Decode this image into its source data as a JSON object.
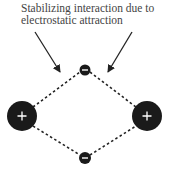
{
  "caption": {
    "line1": "Stabilizing interaction due to",
    "line2": "electrostatic attraction"
  },
  "colors": {
    "ion_fill": "#1a1a1a",
    "sign": "#ffffff",
    "line": "#222222",
    "text": "#444444"
  },
  "ions": [
    {
      "name": "cation-left",
      "charge": "+",
      "cx": 22,
      "cy": 116,
      "r": 15
    },
    {
      "name": "cation-right",
      "charge": "+",
      "cx": 147,
      "cy": 116,
      "r": 15
    },
    {
      "name": "anion-top",
      "charge": "-",
      "cx": 85,
      "cy": 70,
      "r": 5.5
    },
    {
      "name": "anion-bottom",
      "charge": "-",
      "cx": 85,
      "cy": 158,
      "r": 6
    }
  ],
  "arrows": [
    {
      "name": "arrow-left",
      "x1": 35,
      "y1": 32,
      "x2": 60,
      "y2": 72
    },
    {
      "name": "arrow-right",
      "x1": 132,
      "y1": 32,
      "x2": 108,
      "y2": 72
    }
  ]
}
